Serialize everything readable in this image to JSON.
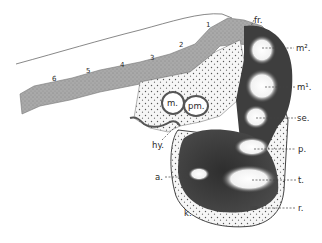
{
  "figure": {
    "type": "anatomical-section-illustration",
    "background": "#ffffff",
    "colors": {
      "dark_tissue": "#3a3a3a",
      "mid_tissue": "#8a8a8a",
      "light_band": "#b5b5b5",
      "stipple_fill": "#f4f4f4",
      "pale_spot": "#f8f8f8",
      "ink": "#2a2a2a"
    },
    "numbers": [
      "6",
      "5",
      "4",
      "3",
      "2",
      "1"
    ],
    "labels": {
      "fr": "fr.",
      "m2": "m².",
      "m1": "m¹.",
      "se": "se.",
      "p": "p.",
      "t": "t.",
      "r": "r.",
      "a": "a.",
      "hy": "hy.",
      "k": "k.",
      "m": "m.",
      "pm": "pm."
    }
  }
}
